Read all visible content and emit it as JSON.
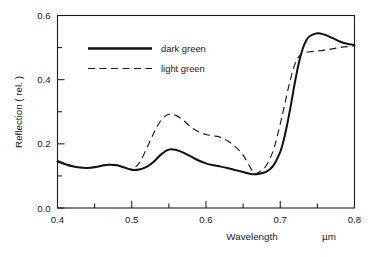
{
  "chart_data": {
    "type": "line",
    "title": "",
    "xlabel": "Wavelength",
    "xunit": "µm",
    "ylabel": "Reflection ( rel. )",
    "xlim": [
      0.4,
      0.8
    ],
    "ylim": [
      0.0,
      0.6
    ],
    "grid": false,
    "legend_position": "upper-left-inside",
    "x_major_ticks": [
      0.4,
      0.5,
      0.6,
      0.7,
      0.8
    ],
    "x_major_tick_labels": [
      "0.4",
      "0.5",
      "0.6",
      "0.7",
      "0.8"
    ],
    "x_minor_ticks": [
      0.45,
      0.55,
      0.65,
      0.75
    ],
    "y_major_ticks": [
      0.0,
      0.2,
      0.4,
      0.6
    ],
    "y_major_tick_labels": [
      "0.0",
      "0.2",
      "0.4",
      "0.6"
    ],
    "y_minor_ticks": [
      0.1,
      0.3,
      0.5
    ],
    "series": [
      {
        "name": "dark green",
        "style": "solid",
        "color": "#111111",
        "x": [
          0.4,
          0.41,
          0.42,
          0.43,
          0.44,
          0.45,
          0.46,
          0.47,
          0.48,
          0.49,
          0.5,
          0.51,
          0.52,
          0.53,
          0.54,
          0.55,
          0.56,
          0.57,
          0.58,
          0.59,
          0.6,
          0.61,
          0.62,
          0.63,
          0.64,
          0.65,
          0.66,
          0.665,
          0.67,
          0.68,
          0.69,
          0.7,
          0.705,
          0.71,
          0.715,
          0.72,
          0.725,
          0.73,
          0.735,
          0.74,
          0.75,
          0.76,
          0.77,
          0.78,
          0.79,
          0.8
        ],
        "values": [
          0.145,
          0.137,
          0.13,
          0.126,
          0.125,
          0.127,
          0.132,
          0.135,
          0.133,
          0.126,
          0.119,
          0.12,
          0.128,
          0.145,
          0.168,
          0.182,
          0.181,
          0.172,
          0.16,
          0.148,
          0.139,
          0.133,
          0.129,
          0.124,
          0.118,
          0.112,
          0.106,
          0.105,
          0.106,
          0.112,
          0.13,
          0.175,
          0.215,
          0.268,
          0.33,
          0.395,
          0.452,
          0.495,
          0.522,
          0.536,
          0.545,
          0.54,
          0.53,
          0.519,
          0.512,
          0.508
        ]
      },
      {
        "name": "light green",
        "style": "dashed",
        "color": "#1a1a1a",
        "x": [
          0.4,
          0.41,
          0.42,
          0.43,
          0.44,
          0.45,
          0.46,
          0.47,
          0.48,
          0.49,
          0.5,
          0.51,
          0.52,
          0.53,
          0.54,
          0.55,
          0.56,
          0.57,
          0.58,
          0.59,
          0.6,
          0.61,
          0.62,
          0.63,
          0.64,
          0.65,
          0.66,
          0.665,
          0.67,
          0.68,
          0.69,
          0.695,
          0.7,
          0.705,
          0.71,
          0.715,
          0.72,
          0.725,
          0.73,
          0.74,
          0.75,
          0.76,
          0.77,
          0.78,
          0.79,
          0.8
        ],
        "values": [
          0.148,
          0.139,
          0.131,
          0.127,
          0.126,
          0.128,
          0.133,
          0.136,
          0.134,
          0.127,
          0.122,
          0.14,
          0.185,
          0.235,
          0.275,
          0.292,
          0.288,
          0.272,
          0.252,
          0.238,
          0.229,
          0.225,
          0.22,
          0.208,
          0.19,
          0.165,
          0.125,
          0.108,
          0.11,
          0.128,
          0.175,
          0.215,
          0.262,
          0.312,
          0.365,
          0.412,
          0.45,
          0.472,
          0.483,
          0.487,
          0.489,
          0.492,
          0.496,
          0.5,
          0.503,
          0.505
        ]
      }
    ]
  },
  "legend": {
    "entries": [
      {
        "label": "dark green"
      },
      {
        "label": "light green"
      }
    ]
  }
}
